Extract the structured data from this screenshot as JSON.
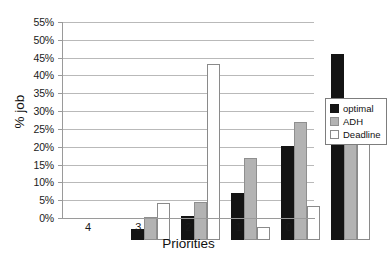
{
  "chart_data": {
    "type": "bar",
    "title": "",
    "xlabel": "Priorities",
    "ylabel": "% job",
    "categories": [
      "4",
      "3",
      "2",
      "1",
      "0"
    ],
    "series": [
      {
        "name": "optimal",
        "color": "#141414",
        "values": [
          3.2,
          6.7,
          13.2,
          26.3,
          52.3
        ]
      },
      {
        "name": "ADH",
        "color": "#b3b3b3",
        "values": [
          6.5,
          10.8,
          23.0,
          33.0,
          29.1
        ]
      },
      {
        "name": "Deadline",
        "color": "#ffffff",
        "values": [
          10.3,
          49.5,
          3.6,
          9.5,
          29.5
        ]
      }
    ],
    "ylim": [
      0,
      55
    ],
    "ytick_step": 5,
    "ytick_labels": [
      "0%",
      "5%",
      "10%",
      "15%",
      "20%",
      "25%",
      "30%",
      "35%",
      "40%",
      "45%",
      "50%",
      "55%"
    ],
    "grid": true,
    "legend_position": "right"
  },
  "legend": {
    "entries": [
      {
        "label": "optimal"
      },
      {
        "label": "ADH"
      },
      {
        "label": "Deadline"
      }
    ]
  }
}
